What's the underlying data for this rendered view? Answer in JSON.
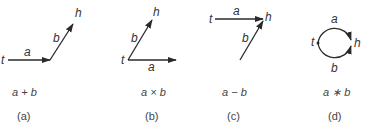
{
  "figures": [
    {
      "id": "a",
      "caption": "(a)",
      "formula": "a + b",
      "labels": {
        "tail": "t",
        "head": "h",
        "edge1": "a",
        "edge2": "b"
      },
      "description": "series: a from t, then b ending at h"
    },
    {
      "id": "b",
      "caption": "(b)",
      "formula": "a × b",
      "labels": {
        "tail": "t",
        "head": "h",
        "edge1": "a",
        "edge2": "b"
      },
      "description": "both a and b start at t; b ends at h"
    },
    {
      "id": "c",
      "caption": "(c)",
      "formula": "a − b",
      "labels": {
        "tail": "t",
        "head": "h",
        "edge1": "a",
        "edge2": "b"
      },
      "description": "a from t to h; b ends at h"
    },
    {
      "id": "d",
      "caption": "(d)",
      "formula": "a ∗ b",
      "labels": {
        "tail": "t",
        "head": "h",
        "edge1": "a",
        "edge2": "b"
      },
      "description": "parallel: a (upper arc) and b (lower arc) from t to h"
    }
  ],
  "colors": {
    "stroke": "#2a2a2a",
    "text": "#333333"
  }
}
